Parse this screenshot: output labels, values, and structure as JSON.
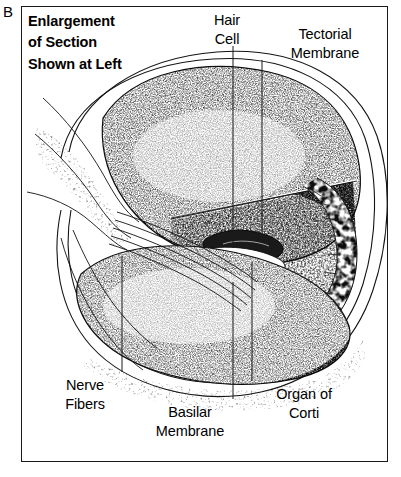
{
  "figure": {
    "panel_letter": "B",
    "title": "Enlargement\nof Section\nShown at Left",
    "style": "black-and-white stippled line engraving",
    "frame": {
      "border_color": "#1a1a1a",
      "background": "#ffffff"
    }
  },
  "labels": {
    "hair_cell": "Hair\nCell",
    "tectorial_membrane": "Tectorial\nMembrane",
    "nerve_fibers": "Nerve\nFibers",
    "basilar_membrane": "Basilar\nMembrane",
    "organ_of_corti": "Organ of\nCorti"
  },
  "colors": {
    "ink": "#000000",
    "frame": "#1a1a1a",
    "leader_line": "#1b1b1b",
    "paper": "#ffffff"
  },
  "leader_lines": [
    {
      "name": "hair-cell-leader",
      "x": 233,
      "y_top": 46,
      "y_bottom": 248
    },
    {
      "name": "tectorial-leader",
      "x": 262,
      "y_top": 60,
      "y_bottom": 232
    },
    {
      "name": "nerve-fibers-leader",
      "x": 122,
      "y_top": 256,
      "y_bottom": 372
    },
    {
      "name": "basilar-membrane-leader",
      "x": 233,
      "y_top": 282,
      "y_bottom": 399
    },
    {
      "name": "organ-corti-leader",
      "x": 252,
      "y_top": 262,
      "y_bottom": 381
    }
  ],
  "anatomy": {
    "outer_bone_wall": "spiral bony capsule outline",
    "scala_vestibuli": "upper stippled chamber",
    "scala_tympani": "lower stippled chamber",
    "reissner_membrane": "thin white diagonal line across upper chamber",
    "cochlear_duct": "triangular middle compartment",
    "stria_vascularis": "cellular bubbly band on right wall",
    "spiral_ganglion_nerve_bundle": "fine curved fibers entering from left modiolus",
    "organ_of_corti_detail": "hair cells with nuclei beneath tongue-shaped tectorial flap"
  }
}
